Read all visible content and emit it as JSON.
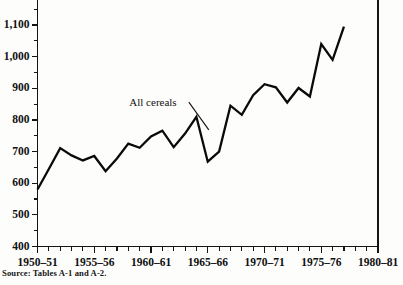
{
  "chart_data": {
    "type": "line",
    "title": "",
    "subtitle": "",
    "xlabel": "",
    "ylabel": "",
    "grid": false,
    "legend_position": "inline-annotation",
    "xlim": [
      1950,
      1980
    ],
    "ylim": [
      400,
      1150
    ],
    "y_ticks_major": [
      400,
      500,
      600,
      700,
      800,
      900,
      1000,
      1100
    ],
    "y_tick_labels": [
      "400",
      "500",
      "600",
      "700",
      "800",
      "900",
      "1,000",
      "1,100"
    ],
    "y_minor_step": 50,
    "x_ticks_major": [
      1950,
      1955,
      1960,
      1965,
      1970,
      1975,
      1980
    ],
    "x_tick_labels": [
      "1950–51",
      "1955–56",
      "1960–61",
      "1965–66",
      "1970–71",
      "1975–76",
      "1980–81"
    ],
    "x_minor_step": 1,
    "annotations": [
      {
        "text": "All cereals",
        "x": 1963.2,
        "y": 845,
        "points_to_x": 1964.3,
        "points_to_y": 775
      }
    ],
    "series": [
      {
        "name": "All cereals",
        "color": "#0a0a0a",
        "x": [
          1950,
          1951,
          1952,
          1953,
          1954,
          1955,
          1956,
          1957,
          1958,
          1959,
          1960,
          1961,
          1962,
          1963,
          1964,
          1965,
          1966,
          1967,
          1968,
          1969,
          1970,
          1971,
          1972,
          1973,
          1974,
          1975,
          1976,
          1977
        ],
        "x_labels": [
          "1950–51",
          "1951–52",
          "1952–53",
          "1953–54",
          "1954–55",
          "1955–56",
          "1956–57",
          "1957–58",
          "1958–59",
          "1959–60",
          "1960–61",
          "1961–62",
          "1962–63",
          "1963–64",
          "1964–65",
          "1965–66",
          "1966–67",
          "1967–68",
          "1968–69",
          "1969–70",
          "1970–71",
          "1971–72",
          "1972–73",
          "1973–74",
          "1974–75",
          "1975–76",
          "1976–77",
          "1977–78"
        ],
        "values": [
          580,
          645,
          711,
          688,
          672,
          686,
          638,
          678,
          725,
          712,
          748,
          766,
          714,
          757,
          810,
          668,
          700,
          845,
          816,
          878,
          913,
          903,
          855,
          901,
          874,
          1040,
          990,
          1095
        ]
      }
    ]
  },
  "source": {
    "note": "Source: Tables A-1 and A-2."
  }
}
